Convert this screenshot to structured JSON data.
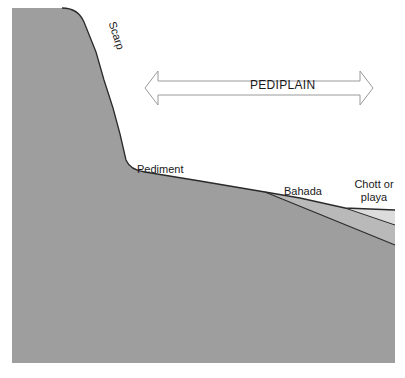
{
  "diagram": {
    "labels": {
      "scarp": "Scarp",
      "pediplain": "PEDIPLAIN",
      "pediment": "Pediment",
      "bahada": "Bahada",
      "chott_line1": "Chott or",
      "chott_line2": "playa"
    },
    "colors": {
      "bedrock": "#9e9e9e",
      "bahada_fill": "#b9b9b9",
      "playa_fill": "#dcdcdc",
      "outline": "#2a2a2a",
      "arrow_stroke": "#9a9a9a",
      "background": "#ffffff"
    }
  }
}
